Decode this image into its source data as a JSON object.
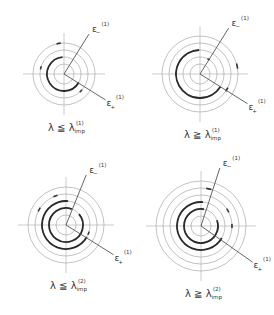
{
  "panels": [
    {
      "id": "p1",
      "caption": {
        "lambda": "λ",
        "rel": "≦",
        "lambda2": "λ",
        "sub": "imp",
        "sup": "(1)"
      },
      "center": [
        64,
        74
      ],
      "radii": [
        10,
        17,
        24,
        31
      ],
      "bold_arcs": [
        {
          "r": 17,
          "from": 95,
          "to": 330
        }
      ],
      "marks": [
        {
          "r": 31,
          "a": 100
        },
        {
          "r": 24,
          "a": 165
        },
        {
          "r": 24,
          "a": 315
        }
      ],
      "eps_minus": {
        "label": "ε",
        "sub": "−",
        "sup": "(1)",
        "angle": 58
      },
      "eps_plus": {
        "label": "ε",
        "sub": "+",
        "sup": "(1)",
        "angle": -32
      }
    },
    {
      "id": "p2",
      "caption": {
        "lambda": "λ",
        "rel": "≧",
        "lambda2": "λ",
        "sub": "imp",
        "sup": "(1)"
      },
      "center": [
        200,
        74
      ],
      "radii": [
        10,
        17,
        24,
        31,
        38
      ],
      "bold_arcs": [
        {
          "r": 24,
          "from": 92,
          "to": 328
        }
      ],
      "marks": [
        {
          "r": 17,
          "a": 60
        },
        {
          "r": 38,
          "a": 12
        },
        {
          "r": 24,
          "a": 180
        },
        {
          "r": 31,
          "a": 330
        }
      ],
      "eps_minus": {
        "label": "ε",
        "sub": "−",
        "sup": "(1)",
        "angle": 58
      },
      "eps_plus": {
        "label": "ε",
        "sub": "+",
        "sup": "(1)",
        "angle": -32
      }
    },
    {
      "id": "p3",
      "caption": {
        "lambda": "λ",
        "rel": "≦",
        "lambda2": "λ",
        "sub": "imp",
        "sup": "(2)"
      },
      "center": [
        66,
        225
      ],
      "radii": [
        10,
        17,
        24,
        31,
        38
      ],
      "bold_arcs": [
        {
          "r": 17,
          "from": 70,
          "to": 400
        },
        {
          "r": 24,
          "from": 85,
          "to": 330
        }
      ],
      "marks": [
        {
          "r": 31,
          "a": 110
        },
        {
          "r": 31,
          "a": 150
        },
        {
          "r": 24,
          "a": 340
        }
      ],
      "eps_minus": {
        "label": "ε",
        "sub": "−",
        "sup": "(1)",
        "angle": 68
      },
      "eps_plus": {
        "label": "ε",
        "sub": "+",
        "sup": "(1)",
        "angle": -32
      }
    },
    {
      "id": "p4",
      "caption": {
        "lambda": "λ",
        "rel": "≧",
        "lambda2": "λ",
        "sub": "imp",
        "sup": "(2)"
      },
      "center": [
        201,
        226
      ],
      "radii": [
        10,
        17,
        24,
        31,
        38,
        45
      ],
      "bold_arcs": [
        {
          "r": 17,
          "from": 80,
          "to": 380
        },
        {
          "r": 24,
          "from": 85,
          "to": 330
        }
      ],
      "marks": [
        {
          "r": 38,
          "a": 78
        },
        {
          "r": 31,
          "a": 30
        },
        {
          "r": 31,
          "a": 0
        }
      ],
      "eps_minus": {
        "label": "ε",
        "sub": "−",
        "sup": "(1)",
        "angle": 72
      },
      "eps_plus": {
        "label": "ε",
        "sub": "+",
        "sup": "(1)",
        "angle": -35
      }
    }
  ]
}
